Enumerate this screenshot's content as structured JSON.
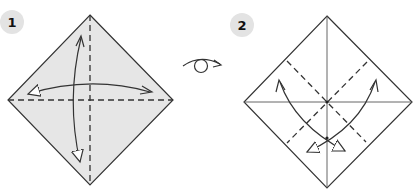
{
  "steps": [
    {
      "number": "1",
      "description": "Valley fold in half both ways and unfold",
      "paper_color": "#e6e6e6",
      "creases": [
        "horizontal-valley-dashed",
        "vertical-valley-dashed"
      ],
      "arrows": [
        "fold-unfold-horizontal",
        "fold-unfold-vertical"
      ]
    },
    {
      "number": "2",
      "description": "Turn over, then valley fold corners diagonally and unfold",
      "paper_color": "#ffffff",
      "creases": [
        "horizontal-crease",
        "vertical-crease",
        "diagonal-valley-dashed-left",
        "diagonal-valley-dashed-right"
      ],
      "arrows": [
        "fold-unfold-left-diagonal",
        "fold-unfold-right-diagonal"
      ]
    }
  ],
  "turn_over_symbol": "turn-over-icon",
  "colors": {
    "line": "#333333",
    "badge": "#e3e3e3",
    "paper_step1": "#e6e6e6",
    "paper_step2": "#ffffff"
  }
}
